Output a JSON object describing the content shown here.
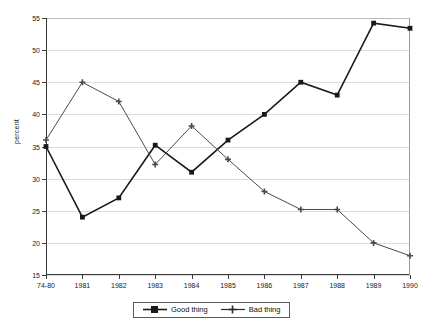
{
  "chart_data": {
    "type": "line",
    "title": "",
    "subtitle": "",
    "xlabel": "",
    "ylabel": "percent",
    "categories": [
      "74-80",
      "1981",
      "1982",
      "1983",
      "1984",
      "1985",
      "1986",
      "1987",
      "1988",
      "1989",
      "1990"
    ],
    "ylim": [
      15,
      55
    ],
    "yticks": [
      15,
      20,
      25,
      30,
      35,
      40,
      45,
      50,
      55
    ],
    "grid": true,
    "legend_position": "bottom-center",
    "series": [
      {
        "name": "Good thing",
        "marker": "square",
        "color": "#1a1a1a",
        "values": [
          35,
          24,
          27,
          35.2,
          31,
          36,
          40,
          45,
          43,
          54.2,
          53.4
        ]
      },
      {
        "name": "Bad thing",
        "marker": "plus",
        "color": "#4a4a4a",
        "values": [
          36,
          45,
          42,
          32.2,
          38.2,
          33,
          28,
          25.2,
          25.2,
          20,
          18
        ]
      }
    ]
  },
  "legend": {
    "items": [
      {
        "label": "Good thing",
        "marker": "square"
      },
      {
        "label": "Bad thing",
        "marker": "plus"
      }
    ]
  }
}
